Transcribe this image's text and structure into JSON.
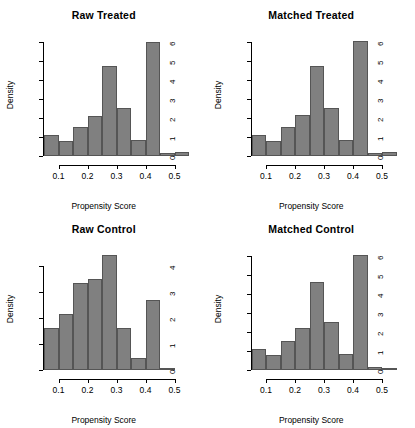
{
  "figure": {
    "background": "#ffffff",
    "bar_fill": "#808080",
    "bar_border": "#555555",
    "layout": "2x2 grid of histogram panels"
  },
  "chart_data": [
    {
      "type": "bar",
      "title": "Raw Treated",
      "xlabel": "Propensity Score",
      "ylabel": "Density",
      "xlim": [
        0.05,
        0.55
      ],
      "ylim": [
        0,
        6.3
      ],
      "xticks": [
        0.1,
        0.2,
        0.3,
        0.4,
        0.5
      ],
      "xtick_labels": [
        "0.1",
        "0.2",
        "0.3",
        "0.4",
        "0.5"
      ],
      "yticks": [
        0,
        1,
        2,
        3,
        4,
        5,
        6
      ],
      "ytick_labels": [
        "0",
        "1",
        "2",
        "3",
        "4",
        "5",
        "6"
      ],
      "grid": false,
      "legend": "none",
      "bin_width": 0.05,
      "bin_edges": [
        0.05,
        0.1,
        0.15,
        0.2,
        0.25,
        0.3,
        0.35,
        0.4,
        0.45,
        0.5,
        0.55
      ],
      "categories": [
        "0.05-0.10",
        "0.10-0.15",
        "0.15-0.20",
        "0.20-0.25",
        "0.25-0.30",
        "0.30-0.35",
        "0.35-0.40",
        "0.40-0.45",
        "0.45-0.50",
        "0.50-0.55"
      ],
      "values": [
        1.1,
        0.8,
        1.5,
        2.1,
        4.7,
        2.5,
        0.85,
        6.0,
        0.15,
        0.2
      ]
    },
    {
      "type": "bar",
      "title": "Matched Treated",
      "xlabel": "Propensity Score",
      "ylabel": "Density",
      "xlim": [
        0.05,
        0.55
      ],
      "ylim": [
        0,
        6.3
      ],
      "xticks": [
        0.1,
        0.2,
        0.3,
        0.4,
        0.5
      ],
      "xtick_labels": [
        "0.1",
        "0.2",
        "0.3",
        "0.4",
        "0.5"
      ],
      "yticks": [
        0,
        1,
        2,
        3,
        4,
        5,
        6
      ],
      "ytick_labels": [
        "0",
        "1",
        "2",
        "3",
        "4",
        "5",
        "6"
      ],
      "grid": false,
      "legend": "none",
      "bin_width": 0.05,
      "bin_edges": [
        0.05,
        0.1,
        0.15,
        0.2,
        0.25,
        0.3,
        0.35,
        0.4,
        0.45,
        0.5,
        0.55
      ],
      "categories": [
        "0.05-0.10",
        "0.10-0.15",
        "0.15-0.20",
        "0.20-0.25",
        "0.25-0.30",
        "0.30-0.35",
        "0.35-0.40",
        "0.40-0.45",
        "0.45-0.50",
        "0.50-0.55"
      ],
      "values": [
        1.1,
        0.8,
        1.5,
        2.15,
        4.7,
        2.5,
        0.85,
        6.05,
        0.15,
        0.22
      ]
    },
    {
      "type": "bar",
      "title": "Raw Control",
      "xlabel": "Propensity Score",
      "ylabel": "Density",
      "xlim": [
        0.05,
        0.55
      ],
      "ylim": [
        0,
        4.6
      ],
      "xticks": [
        0.1,
        0.2,
        0.3,
        0.4,
        0.5
      ],
      "xtick_labels": [
        "0.1",
        "0.2",
        "0.3",
        "0.4",
        "0.5"
      ],
      "yticks": [
        0,
        1,
        2,
        3,
        4
      ],
      "ytick_labels": [
        "0",
        "1",
        "2",
        "3",
        "4"
      ],
      "grid": false,
      "legend": "none",
      "bin_width": 0.05,
      "bin_edges": [
        0.05,
        0.1,
        0.15,
        0.2,
        0.25,
        0.3,
        0.35,
        0.4,
        0.45,
        0.5
      ],
      "categories": [
        "0.05-0.10",
        "0.10-0.15",
        "0.15-0.20",
        "0.20-0.25",
        "0.25-0.30",
        "0.30-0.35",
        "0.35-0.40",
        "0.40-0.45",
        "0.45-0.50"
      ],
      "values": [
        1.6,
        2.15,
        3.35,
        3.5,
        4.4,
        1.6,
        0.45,
        2.7,
        0.05
      ]
    },
    {
      "type": "bar",
      "title": "Matched Control",
      "xlabel": "Propensity Score",
      "ylabel": "Density",
      "xlim": [
        0.05,
        0.55
      ],
      "ylim": [
        0,
        6.3
      ],
      "xticks": [
        0.1,
        0.2,
        0.3,
        0.4,
        0.5
      ],
      "xtick_labels": [
        "0.1",
        "0.2",
        "0.3",
        "0.4",
        "0.5"
      ],
      "yticks": [
        0,
        1,
        2,
        3,
        4,
        5,
        6
      ],
      "ytick_labels": [
        "0",
        "1",
        "2",
        "3",
        "4",
        "5",
        "6"
      ],
      "grid": false,
      "legend": "none",
      "bin_width": 0.05,
      "bin_edges": [
        0.05,
        0.1,
        0.15,
        0.2,
        0.25,
        0.3,
        0.35,
        0.4,
        0.45,
        0.5,
        0.55
      ],
      "categories": [
        "0.05-0.10",
        "0.10-0.15",
        "0.15-0.20",
        "0.20-0.25",
        "0.25-0.30",
        "0.30-0.35",
        "0.35-0.40",
        "0.40-0.45",
        "0.45-0.50",
        "0.50-0.55"
      ],
      "values": [
        1.1,
        0.8,
        1.5,
        2.2,
        4.6,
        2.5,
        0.85,
        6.05,
        0.15,
        0.1
      ]
    }
  ]
}
